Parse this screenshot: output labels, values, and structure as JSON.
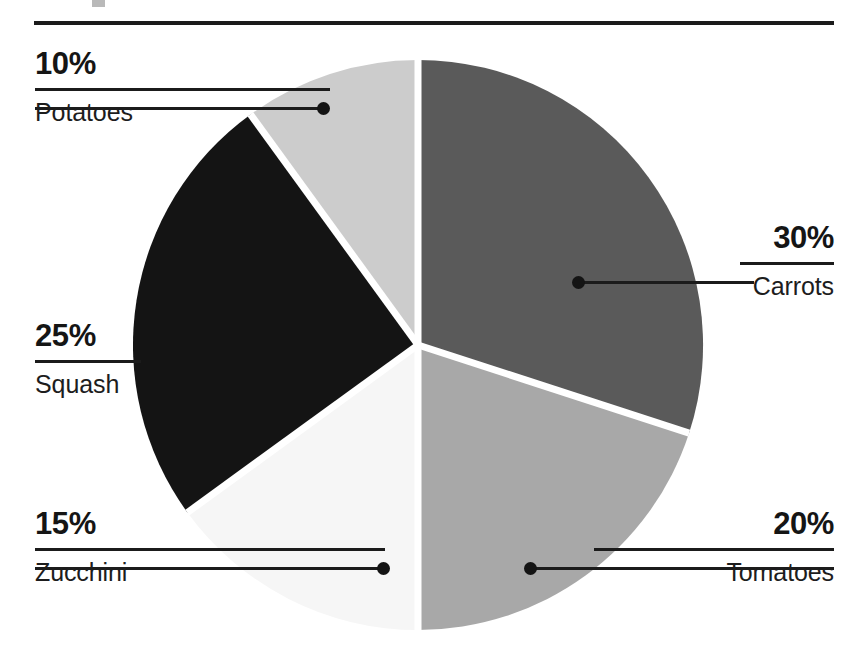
{
  "chart_data": {
    "type": "pie",
    "title": "",
    "categories": [
      "Carrots",
      "Tomatoes",
      "Zucchini",
      "Squash",
      "Potatoes"
    ],
    "values": [
      30,
      20,
      15,
      25,
      10
    ],
    "value_unit": "%",
    "legend_position": "callout-labels",
    "grid": false,
    "slice_colors": [
      "#5a5a5a",
      "#a8a8a8",
      "#f6f6f6",
      "#141414",
      "#cccccc"
    ],
    "start_angle_deg": 0,
    "direction": "clockwise",
    "slices": [
      {
        "label": "Carrots",
        "percent_text": "30%",
        "value": 30,
        "color": "#5a5a5a"
      },
      {
        "label": "Tomatoes",
        "percent_text": "20%",
        "value": 20,
        "color": "#a8a8a8"
      },
      {
        "label": "Zucchini",
        "percent_text": "15%",
        "value": 15,
        "color": "#f6f6f6"
      },
      {
        "label": "Squash",
        "percent_text": "25%",
        "value": 25,
        "color": "#141414"
      },
      {
        "label": "Potatoes",
        "percent_text": "10%",
        "value": 10,
        "color": "#cccccc"
      }
    ]
  },
  "callouts": {
    "potatoes": {
      "percent": "10%",
      "name": "Potatoes"
    },
    "carrots": {
      "percent": "30%",
      "name": "Carrots"
    },
    "squash": {
      "percent": "25%",
      "name": "Squash"
    },
    "zucchini": {
      "percent": "15%",
      "name": "Zucchini"
    },
    "tomatoes": {
      "percent": "20%",
      "name": "Tomatoes"
    }
  },
  "colors": {
    "ink": "#1b1b1b",
    "separator": "#ffffff",
    "background": "#ffffff"
  }
}
